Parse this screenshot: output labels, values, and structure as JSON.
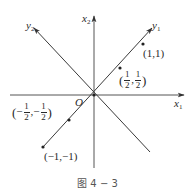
{
  "figure": {
    "caption": "图 4 − 3",
    "origin_label": "O",
    "axes": {
      "x1": {
        "name": "x",
        "sub": "1"
      },
      "x2": {
        "name": "x",
        "sub": "2"
      },
      "y1": {
        "name": "y",
        "sub": "1"
      },
      "y2": {
        "name": "y",
        "sub": "2"
      }
    },
    "points": [
      {
        "id": "p11",
        "label": "(1,1)"
      },
      {
        "id": "phalf",
        "num": "1",
        "den": "2",
        "open": "(",
        "comma": ",",
        "close": ")"
      },
      {
        "id": "pnhalf",
        "minus": "−",
        "num": "1",
        "den": "2",
        "open": "(",
        "comma": ",",
        "close": ")"
      },
      {
        "id": "pm11",
        "label": "(−1,−1)"
      }
    ],
    "colors": {
      "line": "#3a3a3a",
      "axis": "#555555",
      "text": "#2a2a2a"
    }
  }
}
